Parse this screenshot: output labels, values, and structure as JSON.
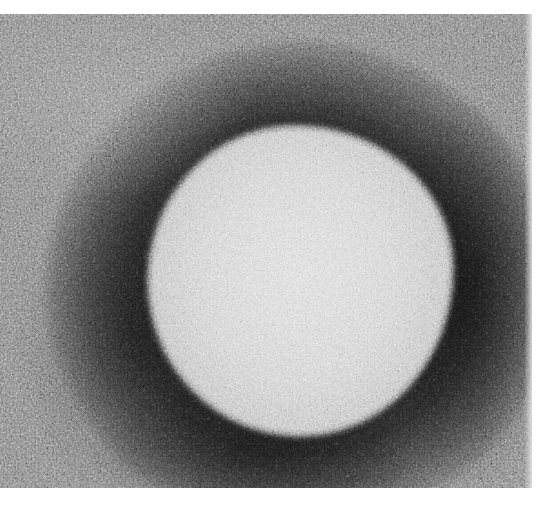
{
  "image": {
    "kind": "grayscale electron micrograph",
    "subject": "roughly spherical particle with bright granular core surrounded by dark halo on grainy gray background",
    "colors": {
      "page_background": "#ffffff",
      "particle_core": "#d2d2d2",
      "halo": "#1f1f1f",
      "background_grain": "#848484"
    },
    "layout": {
      "figure_top_margin_px": 14,
      "figure_bottom_px": 488,
      "particle_center": [
        300,
        285
      ],
      "particle_radius_px": 152
    }
  }
}
